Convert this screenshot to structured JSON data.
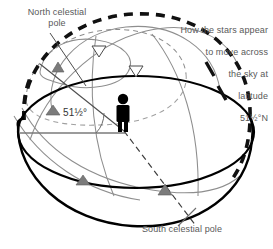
{
  "diagram": {
    "title_ncp": "North celestial\npole",
    "title_scp": "South celestial pole",
    "caption": "How the stars appear\nto move across\nthe sky at\nlatitude\n51½°N",
    "caption_lines": [
      "How the stars appear",
      "to move across",
      "the sky at",
      "latitude",
      "51½°N"
    ],
    "latitude_angle_label": "51½°",
    "latitude_value": "51½°N",
    "observer": "observer-figure",
    "colors": {
      "ink": "#000000",
      "text": "#595959",
      "star_path": "#8c8c8c",
      "arrow_fill": "#7a7a7a",
      "horizon": "#000000",
      "background": "#ffffff"
    },
    "elements": {
      "horizon_ellipse": "horizon-plane",
      "celestial_sphere": "celestial-sphere-dashed-arc",
      "polar_axis": "polar-axis-dashed-line",
      "star_paths_count": 5,
      "direction_arrows_filled": 4,
      "direction_arrows_open": 2
    }
  }
}
